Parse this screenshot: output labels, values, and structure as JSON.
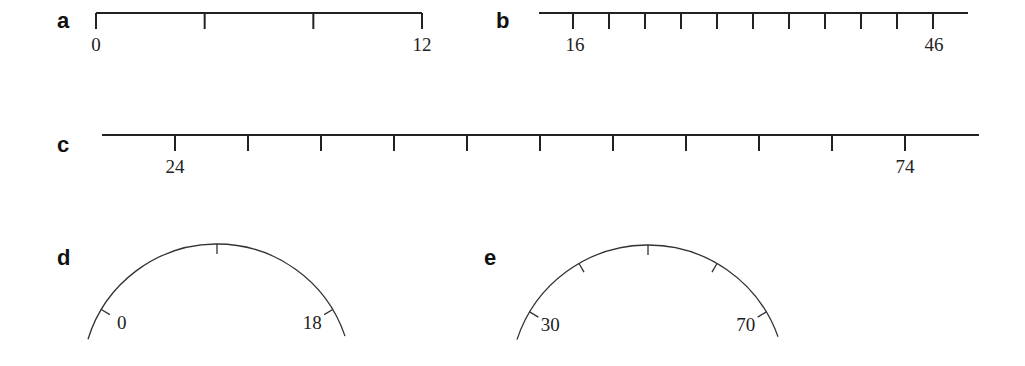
{
  "panels": [
    {
      "id": "a",
      "label": "a",
      "type": "linear",
      "label_pos": [
        57,
        28
      ],
      "line": {
        "x1": 96,
        "x2": 422,
        "y": 13,
        "end_caps": true
      },
      "ticks": {
        "count": 4,
        "x_first": 96,
        "x_last": 422,
        "length": 16
      },
      "tick_labels": [
        {
          "index": 0,
          "text": "0",
          "x": 96
        },
        {
          "index": 3,
          "text": "12",
          "x": 422
        }
      ],
      "range": [
        0,
        12
      ]
    },
    {
      "id": "b",
      "label": "b",
      "type": "linear",
      "label_pos": [
        496,
        28
      ],
      "line": {
        "x1": 539,
        "x2": 968,
        "y": 13,
        "end_caps": false
      },
      "ticks": {
        "count": 11,
        "x_first": 573,
        "x_last": 933,
        "length": 16
      },
      "tick_labels": [
        {
          "index": 0,
          "text": "16",
          "x": 575
        },
        {
          "index": 10,
          "text": "46",
          "x": 934
        }
      ],
      "range": [
        16,
        46
      ]
    },
    {
      "id": "c",
      "label": "c",
      "type": "linear",
      "label_pos": [
        57,
        152
      ],
      "line": {
        "x1": 102,
        "x2": 979,
        "y": 135,
        "end_caps": false
      },
      "ticks": {
        "count": 11,
        "x_first": 175,
        "x_last": 905,
        "length": 16
      },
      "tick_labels": [
        {
          "index": 0,
          "text": "24",
          "x": 175
        },
        {
          "index": 10,
          "text": "74",
          "x": 905
        }
      ],
      "range": [
        24,
        74
      ]
    },
    {
      "id": "d",
      "label": "d",
      "type": "arc",
      "label_pos": [
        57,
        265
      ],
      "arc": {
        "cx": 217,
        "cy": 379,
        "r": 135,
        "x_left": 88,
        "x_right": 345
      },
      "ticks": [
        {
          "angle_deg": -59,
          "text": "0",
          "text_side": "inner"
        },
        {
          "angle_deg": 0,
          "text": ""
        },
        {
          "angle_deg": 59,
          "text": "18",
          "text_side": "inner"
        }
      ],
      "range": [
        0,
        18
      ]
    },
    {
      "id": "e",
      "label": "e",
      "type": "arc",
      "label_pos": [
        484,
        265
      ],
      "arc": {
        "cx": 648,
        "cy": 383,
        "r": 138,
        "x_left": 517,
        "x_right": 778
      },
      "ticks": [
        {
          "angle_deg": -59,
          "text": "30",
          "text_side": "inner"
        },
        {
          "angle_deg": -30,
          "text": ""
        },
        {
          "angle_deg": 0,
          "text": ""
        },
        {
          "angle_deg": 30,
          "text": ""
        },
        {
          "angle_deg": 59,
          "text": "70",
          "text_side": "inner"
        }
      ],
      "range": [
        30,
        70
      ]
    }
  ],
  "colors": {
    "ink": "#222222",
    "background": "#ffffff"
  }
}
